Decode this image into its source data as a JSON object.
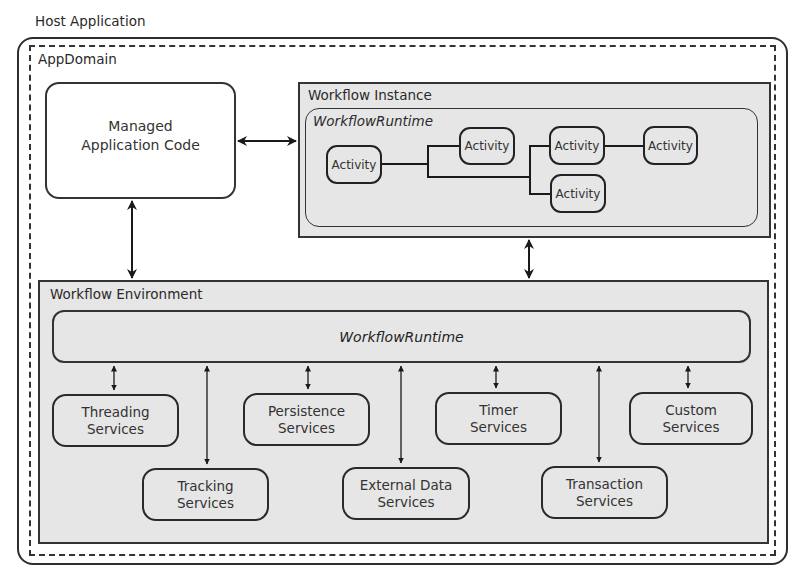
{
  "host": {
    "label": "Host Application"
  },
  "appdomain": {
    "label": "AppDomain"
  },
  "managed_code": {
    "line1": "Managed",
    "line2": "Application Code"
  },
  "workflow_instance": {
    "label": "Workflow Instance",
    "runtime_label": "WorkflowRuntime",
    "activities": [
      {
        "label": "Activity"
      },
      {
        "label": "Activity"
      },
      {
        "label": "Activity"
      },
      {
        "label": "Activity"
      },
      {
        "label": "Activity"
      }
    ]
  },
  "workflow_environment": {
    "label": "Workflow Environment",
    "runtime_label": "WorkflowRuntime",
    "services": [
      {
        "line1": "Threading",
        "line2": "Services"
      },
      {
        "line1": "Tracking",
        "line2": "Services"
      },
      {
        "line1": "Persistence",
        "line2": "Services"
      },
      {
        "line1": "External Data",
        "line2": "Services"
      },
      {
        "line1": "Timer",
        "line2": "Services"
      },
      {
        "line1": "Transaction",
        "line2": "Services"
      },
      {
        "line1": "Custom",
        "line2": "Services"
      }
    ]
  },
  "colors": {
    "box_fill": "#e6e6e6",
    "stroke": "#2e2e2e",
    "background": "#ffffff"
  }
}
